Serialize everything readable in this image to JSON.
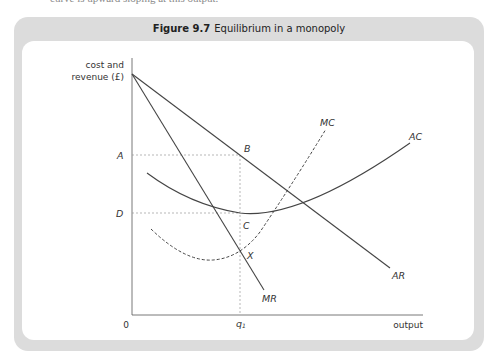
{
  "header_fragment": "curve is upward sloping at this output.",
  "figure": {
    "number": "Figure 9.7",
    "title": "Equilibrium in a monopoly"
  },
  "chart_data": {
    "type": "diagram",
    "title": "Equilibrium in a monopoly",
    "ylabel_line1": "cost and",
    "ylabel_line2": "revenue (£)",
    "xlabel": "output",
    "origin_label": "0",
    "y_levels": [
      {
        "name": "A",
        "y": 155
      },
      {
        "name": "D",
        "y": 213
      }
    ],
    "x_levels": [
      {
        "name": "q1",
        "x": 240
      }
    ],
    "points": [
      {
        "name": "B",
        "x": 240,
        "y": 155
      },
      {
        "name": "C",
        "x": 240,
        "y": 213
      },
      {
        "name": "X",
        "x": 240,
        "y": 251
      }
    ],
    "curves": [
      {
        "name": "AR",
        "style": "solid",
        "path": "M132 74 L390 268"
      },
      {
        "name": "MR",
        "style": "solid",
        "path": "M132 74 L264 290"
      },
      {
        "name": "AC",
        "style": "solid",
        "path": "M147 173 Q190 205 240 213 Q300 220 410 143"
      },
      {
        "name": "MC",
        "style": "dashed",
        "path": "M151 229 Q185 262 213 260 Q240 258 260 232 Q295 180 326 129"
      }
    ],
    "labels": {
      "AR": {
        "x": 392,
        "y": 279
      },
      "MR": {
        "x": 262,
        "y": 302
      },
      "AC": {
        "x": 409,
        "y": 140
      },
      "MC": {
        "x": 320,
        "y": 126
      },
      "A": {
        "x": 117,
        "y": 159
      },
      "D": {
        "x": 116,
        "y": 217
      },
      "B": {
        "x": 244,
        "y": 152
      },
      "C": {
        "x": 243,
        "y": 229
      },
      "X": {
        "x": 247,
        "y": 259
      },
      "q1": {
        "x": 236,
        "y": 327
      }
    },
    "colors": {
      "line": "#444444",
      "guide": "#999999",
      "frame": "#dcdcdc"
    }
  }
}
